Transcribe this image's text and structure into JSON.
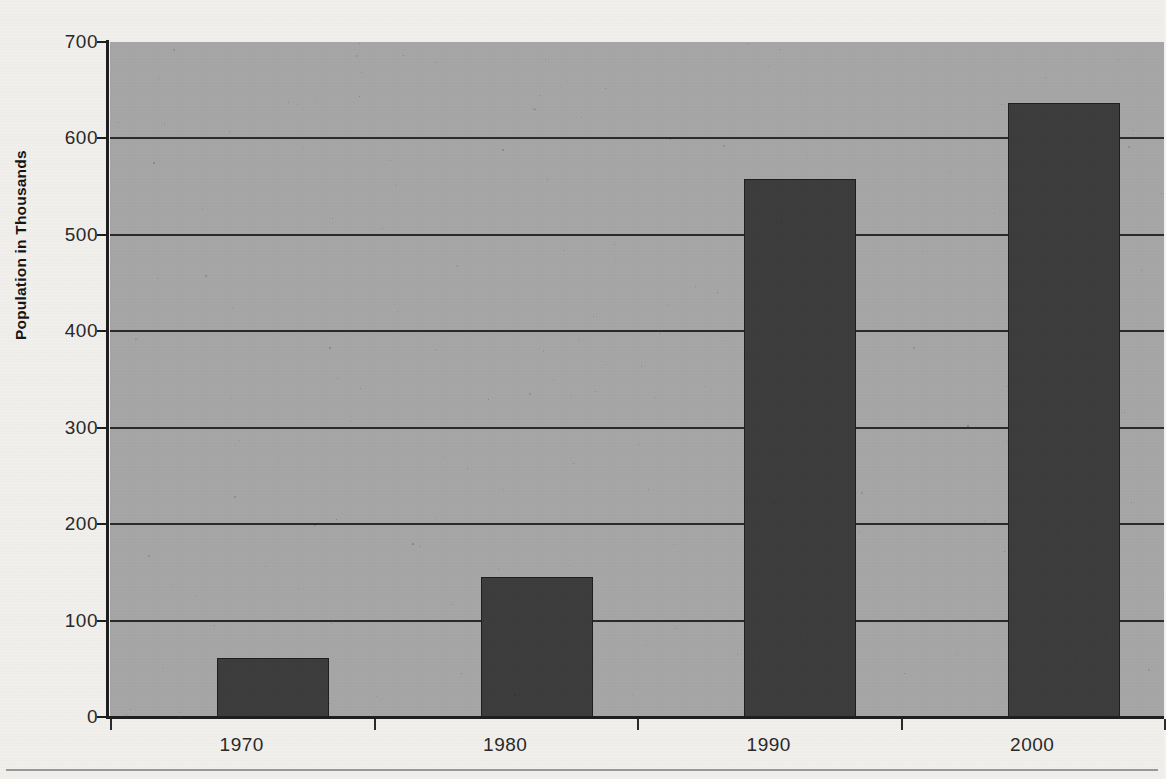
{
  "chart_data": {
    "type": "bar",
    "title": "",
    "xlabel": "",
    "ylabel": "Population in Thousands",
    "categories": [
      "1970",
      "1980",
      "1990",
      "2000"
    ],
    "values": [
      61,
      145,
      558,
      637
    ],
    "series": [
      {
        "name": "Population",
        "values": [
          61,
          145,
          558,
          637
        ]
      }
    ],
    "ylim": [
      0,
      700
    ],
    "y_ticks": [
      0,
      100,
      200,
      300,
      400,
      500,
      600,
      700
    ],
    "y_tick_labels": [
      "0",
      "100",
      "200",
      "300",
      "400",
      "500",
      "600",
      "700"
    ],
    "grid": true,
    "grid_axis": "y",
    "legend": false,
    "legend_position": "none",
    "bar_color": "#3c3c3c",
    "plot_background_color": "#a9a9a9",
    "page_background_color": "#f3f1ee",
    "axis_color": "#1f1f1f"
  },
  "axes": {
    "y_title": "Population in Thousands"
  }
}
